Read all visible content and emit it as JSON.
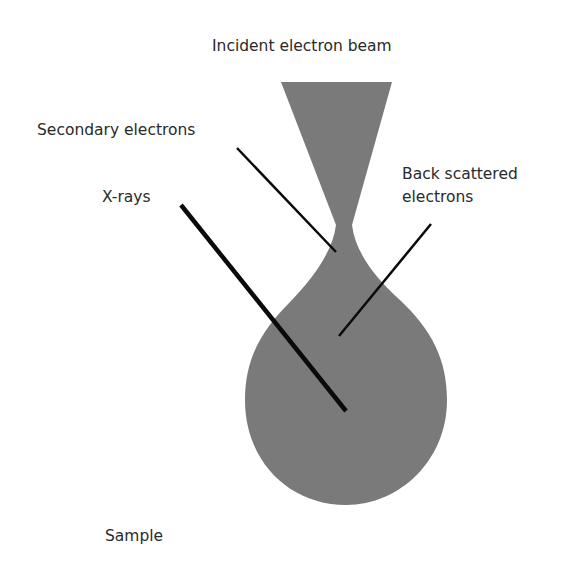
{
  "diagram": {
    "labels": {
      "incident_beam": "Incident electron beam",
      "secondary_electrons": "Secondary  electrons",
      "xrays": "X-rays",
      "backscattered_line1": "Back scattered",
      "backscattered_line2": "electrons",
      "sample": "Sample"
    },
    "colors": {
      "volume_fill": "#7a7a7a",
      "leader_line": "#0a0a0a",
      "text": "#2a2a2a"
    }
  }
}
